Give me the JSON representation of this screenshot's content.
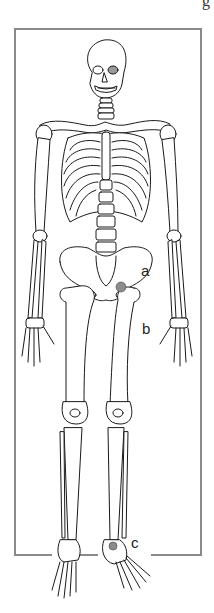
{
  "figure": {
    "cropped_top_text": "g",
    "frame_color": "#8a8a8a",
    "line_color": "#1a1a1a",
    "highlight_color": "#8c8c8c"
  },
  "labels": [
    {
      "id": "a",
      "text": "a",
      "points_to": "hip joint",
      "x": 141,
      "y": 263
    },
    {
      "id": "b",
      "text": "b",
      "points_to": "femur",
      "x": 142,
      "y": 321
    },
    {
      "id": "c",
      "text": "c",
      "points_to": "ankle joint",
      "x": 131,
      "y": 535
    }
  ],
  "markers": [
    {
      "name": "hip-joint-marker",
      "cx": 121,
      "cy": 287,
      "r": 5
    },
    {
      "name": "ankle-joint-marker",
      "cx": 113,
      "cy": 546,
      "r": 4
    }
  ]
}
